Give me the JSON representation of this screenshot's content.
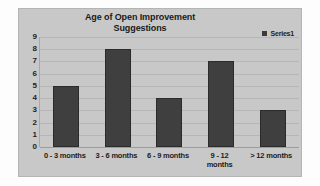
{
  "chart_data": {
    "type": "bar",
    "title": "Age of Open Improvement Suggestions",
    "title_line1": "Age of Open Improvement",
    "title_line2": "Suggestions",
    "xlabel": "",
    "ylabel": "",
    "categories": [
      "0 - 3 months",
      "3 - 6 months",
      "6 - 9 months",
      "9 - 12 months",
      "> 12 months"
    ],
    "category_lines": [
      {
        "l1": "0 - 3 months",
        "l2": ""
      },
      {
        "l1": "3 - 6 months",
        "l2": ""
      },
      {
        "l1": "6 - 9 months",
        "l2": ""
      },
      {
        "l1": "9 - 12",
        "l2": "months"
      },
      {
        "l1": "> 12 months",
        "l2": ""
      }
    ],
    "series": [
      {
        "name": "Series1",
        "values": [
          5,
          8,
          4,
          7,
          3
        ]
      }
    ],
    "values": [
      5,
      8,
      4,
      7,
      3
    ],
    "ylim": [
      0,
      9
    ],
    "ytick_values": [
      9,
      8,
      7,
      6,
      5,
      4,
      3,
      2,
      1,
      0
    ],
    "ytick_labels": [
      "9",
      "8",
      "7",
      "6",
      "5",
      "4",
      "3",
      "2",
      "1",
      "0"
    ],
    "grid": true,
    "grid_axis": "y",
    "legend": {
      "position": "top-right",
      "entries": [
        {
          "label": "Series1",
          "color": "#3f3f3f"
        }
      ]
    },
    "colors": {
      "bar_fill": "#3f3f3f",
      "bar_border": "#2b2b2b",
      "chart_background": "#c8c8c8",
      "plot_background": "#c8c8c8",
      "gridline": "#b6b6b6",
      "text": "#1c1c1c",
      "page_background": "#fdfdfd"
    }
  }
}
